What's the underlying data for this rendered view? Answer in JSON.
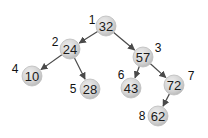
{
  "diagram": {
    "type": "binary-tree",
    "node_fill": "#d6d6d6",
    "edge_color": "#4a4a4a",
    "nodes": [
      {
        "id": 1,
        "value": "32",
        "index_label": "1",
        "cx": 106,
        "cy": 26,
        "lx": 92,
        "ly": 20
      },
      {
        "id": 2,
        "value": "24",
        "index_label": "2",
        "cx": 70,
        "cy": 49,
        "lx": 55,
        "ly": 42
      },
      {
        "id": 3,
        "value": "57",
        "index_label": "3",
        "cx": 143,
        "cy": 57,
        "lx": 158,
        "ly": 48
      },
      {
        "id": 4,
        "value": "10",
        "index_label": "4",
        "cx": 32,
        "cy": 76,
        "lx": 15,
        "ly": 69
      },
      {
        "id": 5,
        "value": "28",
        "index_label": "5",
        "cx": 90,
        "cy": 89,
        "lx": 73,
        "ly": 89
      },
      {
        "id": 6,
        "value": "43",
        "index_label": "6",
        "cx": 131,
        "cy": 88,
        "lx": 121,
        "ly": 75
      },
      {
        "id": 7,
        "value": "72",
        "index_label": "7",
        "cx": 174,
        "cy": 85,
        "lx": 191,
        "ly": 76
      },
      {
        "id": 8,
        "value": "62",
        "index_label": "8",
        "cx": 158,
        "cy": 116,
        "lx": 142,
        "ly": 116
      }
    ],
    "edges": [
      {
        "from": 1,
        "to": 2
      },
      {
        "from": 1,
        "to": 3
      },
      {
        "from": 2,
        "to": 4
      },
      {
        "from": 2,
        "to": 5
      },
      {
        "from": 3,
        "to": 6
      },
      {
        "from": 3,
        "to": 7
      },
      {
        "from": 7,
        "to": 8
      }
    ]
  }
}
